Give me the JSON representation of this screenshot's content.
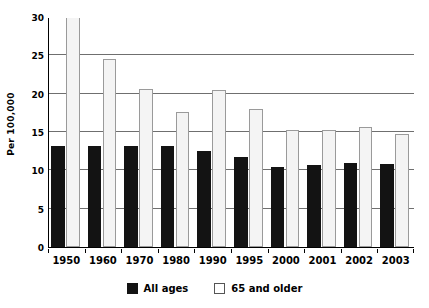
{
  "chart_data": {
    "type": "bar",
    "title": "",
    "subtitle": "",
    "xlabel": "",
    "ylabel": "Per 100,000",
    "categories": [
      "1950",
      "1960",
      "1970",
      "1980",
      "1990",
      "1995",
      "2000",
      "2001",
      "2002",
      "2003"
    ],
    "series": [
      {
        "name": "All ages",
        "color": "#131313",
        "values": [
          13.2,
          13.2,
          13.2,
          13.2,
          12.5,
          11.8,
          10.4,
          10.7,
          10.9,
          10.8
        ]
      },
      {
        "name": "65 and older",
        "color": "#f4f4f4",
        "values": [
          31.1,
          24.5,
          20.6,
          17.6,
          20.5,
          18.0,
          15.2,
          15.3,
          15.6,
          14.8
        ]
      }
    ],
    "ylim": [
      0,
      30
    ],
    "yticks": [
      0,
      5,
      10,
      15,
      20,
      25,
      30
    ],
    "ytick_labels": [
      "0",
      "5",
      "10",
      "15",
      "20",
      "25",
      "30"
    ],
    "grid": true,
    "grid_axis": "y",
    "legend_position": "bottom"
  },
  "legend": {
    "items": [
      {
        "label": "All ages",
        "swatch": "black-square-swatch"
      },
      {
        "label": "65 and older",
        "swatch": "white-square-swatch"
      }
    ]
  }
}
